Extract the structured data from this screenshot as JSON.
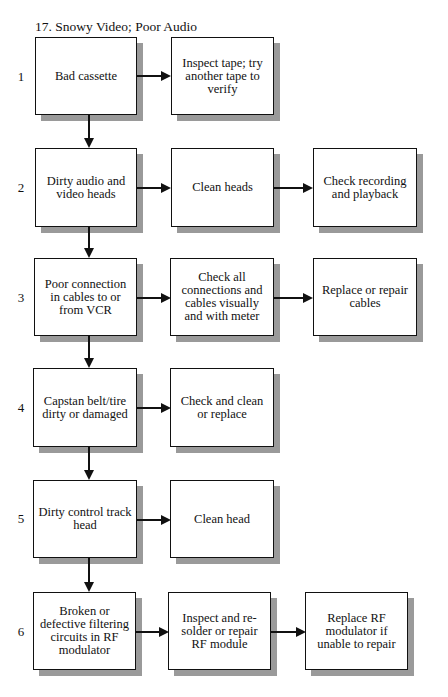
{
  "title": "17. Snowy Video; Poor Audio",
  "rows": [
    {
      "num": "1",
      "cause": "Bad cassette",
      "steps": [
        "Inspect tape; try another tape to verify"
      ]
    },
    {
      "num": "2",
      "cause": "Dirty audio and video heads",
      "steps": [
        "Clean heads",
        "Check recording and playback"
      ]
    },
    {
      "num": "3",
      "cause": "Poor connection in cables to or from VCR",
      "steps": [
        "Check all connections and cables visually and with meter",
        "Replace or repair cables"
      ]
    },
    {
      "num": "4",
      "cause": "Capstan belt/tire dirty or damaged",
      "steps": [
        "Check and clean or replace"
      ]
    },
    {
      "num": "5",
      "cause": "Dirty control track head",
      "steps": [
        "Clean head"
      ]
    },
    {
      "num": "6",
      "cause": "Broken or defective filtering circuits in RF modulator",
      "steps": [
        "Inspect and re-solder or repair RF module",
        "Replace RF modulator if unable to repair"
      ]
    }
  ],
  "colors": {
    "line": "#111111",
    "shadow": "#9a9a9a",
    "background": "#ffffff"
  }
}
